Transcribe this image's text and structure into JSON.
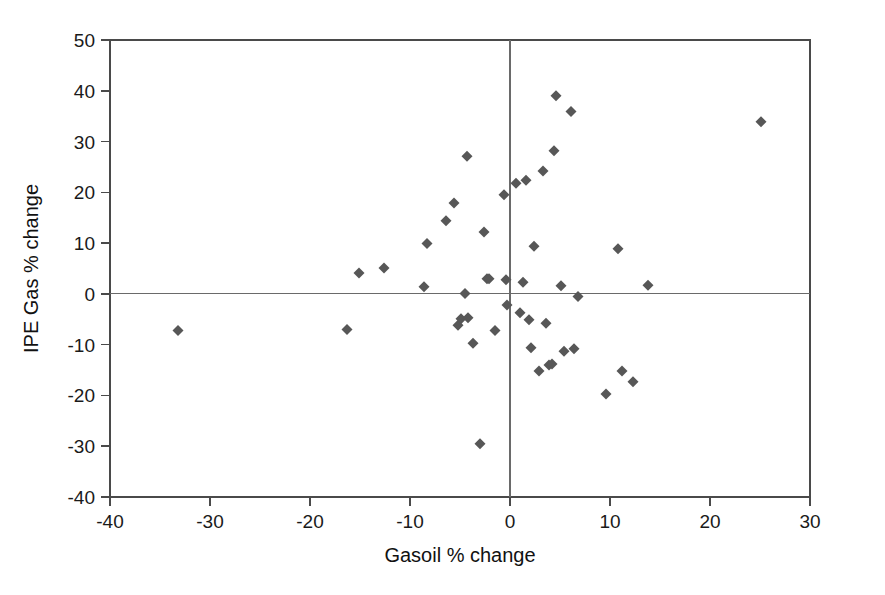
{
  "figure": {
    "background_color": "#ffffff",
    "width": 885,
    "height": 595
  },
  "chart_data": {
    "type": "scatter",
    "title": "",
    "xlabel": "Gasoil % change",
    "ylabel": "IPE Gas % change",
    "xlim": [
      -40,
      30
    ],
    "ylim": [
      -40,
      50
    ],
    "xticks": [
      -40,
      -30,
      -20,
      -10,
      0,
      10,
      20,
      30
    ],
    "xtick_labels": [
      "-40",
      "-30",
      "-20",
      "-10",
      "0",
      "10",
      "20",
      "30"
    ],
    "yticks": [
      -40,
      -30,
      -20,
      -10,
      0,
      10,
      20,
      30,
      40,
      50
    ],
    "ytick_labels": [
      "-40",
      "-30",
      "-20",
      "-10",
      "0",
      "10",
      "20",
      "30",
      "40",
      "50"
    ],
    "grid": false,
    "legend": null,
    "marker": {
      "shape": "diamond",
      "color": "#575757",
      "size": 11
    },
    "reference_lines": [
      {
        "axis": "y",
        "value": 0,
        "color": "#6a6a6a"
      },
      {
        "axis": "x",
        "value": 0,
        "color": "#6a6a6a"
      }
    ],
    "series": [
      {
        "name": "IPE Gas vs Gasoil",
        "points": [
          [
            -33.2,
            -7.2
          ],
          [
            -16.3,
            -7.0
          ],
          [
            -15.1,
            4.1
          ],
          [
            -12.6,
            5.1
          ],
          [
            -8.6,
            1.4
          ],
          [
            -8.3,
            9.9
          ],
          [
            -6.4,
            14.4
          ],
          [
            -5.6,
            17.9
          ],
          [
            -5.2,
            -6.2
          ],
          [
            -4.9,
            -4.9
          ],
          [
            -4.5,
            0.1
          ],
          [
            -4.3,
            27.1
          ],
          [
            -4.2,
            -4.7
          ],
          [
            -3.7,
            -9.7
          ],
          [
            -3.0,
            -29.5
          ],
          [
            -2.6,
            12.2
          ],
          [
            -2.3,
            3.0
          ],
          [
            -2.1,
            3.0
          ],
          [
            -1.5,
            -7.2
          ],
          [
            -0.6,
            19.5
          ],
          [
            -0.4,
            2.8
          ],
          [
            -0.3,
            -2.2
          ],
          [
            0.6,
            21.8
          ],
          [
            1.0,
            -3.7
          ],
          [
            1.3,
            2.3
          ],
          [
            1.6,
            22.4
          ],
          [
            1.9,
            -5.1
          ],
          [
            2.1,
            -10.6
          ],
          [
            2.4,
            9.4
          ],
          [
            2.9,
            -15.2
          ],
          [
            3.3,
            24.2
          ],
          [
            3.6,
            -5.8
          ],
          [
            3.9,
            -14.0
          ],
          [
            4.2,
            -13.8
          ],
          [
            4.4,
            28.2
          ],
          [
            4.6,
            39.0
          ],
          [
            5.1,
            1.6
          ],
          [
            5.4,
            -11.3
          ],
          [
            6.1,
            35.9
          ],
          [
            6.4,
            -10.8
          ],
          [
            6.8,
            -0.5
          ],
          [
            9.6,
            -19.7
          ],
          [
            10.8,
            8.9
          ],
          [
            11.2,
            -15.2
          ],
          [
            12.3,
            -17.3
          ],
          [
            13.8,
            1.7
          ],
          [
            25.1,
            33.9
          ]
        ]
      }
    ]
  }
}
